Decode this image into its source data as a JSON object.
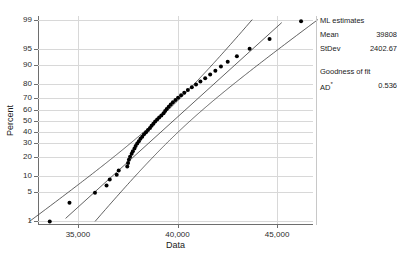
{
  "chart_data": {
    "type": "scatter",
    "title": "",
    "xlabel": "Data",
    "ylabel": "Percent",
    "xlim": [
      33000,
      46800
    ],
    "xticks": [
      35000,
      40000,
      45000
    ],
    "xticklabels": [
      "35,000",
      "40,000",
      "45,000"
    ],
    "yticks": [
      1,
      5,
      10,
      20,
      30,
      40,
      50,
      60,
      70,
      80,
      90,
      95,
      99
    ],
    "yticklabels": [
      "1",
      "5",
      "10",
      "20",
      "30",
      "40",
      "50",
      "60",
      "70",
      "80",
      "90",
      "95",
      "99"
    ],
    "yscale": "normal-probability",
    "grid": true,
    "legend_position": "right",
    "series": [
      {
        "name": "data-points",
        "x": [
          33590,
          34580,
          35860,
          36440,
          36600,
          36950,
          37050,
          37480,
          37520,
          37560,
          37620,
          37700,
          37760,
          37840,
          37900,
          37980,
          38060,
          38140,
          38230,
          38320,
          38420,
          38520,
          38620,
          38700,
          38790,
          38880,
          38980,
          39080,
          39190,
          39300,
          39380,
          39460,
          39560,
          39660,
          39770,
          39900,
          40030,
          40180,
          40340,
          40520,
          40720,
          40930,
          41150,
          41390,
          41640,
          41900,
          42180,
          42520,
          42980,
          43620,
          44620,
          46200
        ],
        "y": [
          1.0,
          2.9,
          4.8,
          6.7,
          8.7,
          10.6,
          12.5,
          14.4,
          16.3,
          18.3,
          20.2,
          22.1,
          24.0,
          25.9,
          27.9,
          29.8,
          31.7,
          33.6,
          35.5,
          37.5,
          39.4,
          41.3,
          43.2,
          45.1,
          47.1,
          49.0,
          50.9,
          52.8,
          54.7,
          56.7,
          58.6,
          60.5,
          62.4,
          64.3,
          66.3,
          68.2,
          70.1,
          72.0,
          73.9,
          75.9,
          77.8,
          79.7,
          81.6,
          83.5,
          85.5,
          87.4,
          89.3,
          91.2,
          93.1,
          95.1,
          97.0,
          98.9
        ]
      }
    ],
    "fit_line": {
      "name": "ml-fit-line",
      "mean": 39808,
      "stdev": 2402.67
    },
    "confidence_bands": {
      "name": "confidence-interval-bands",
      "level": 95
    }
  },
  "legend": {
    "ml_heading": "ML estimates",
    "mean_label": "Mean",
    "mean_value": "39808",
    "stdev_label": "StDev",
    "stdev_value": "2402.67",
    "gof_heading": "Goodness of fit",
    "ad_label": "AD",
    "ad_sup": "*",
    "ad_value": "0.536"
  }
}
